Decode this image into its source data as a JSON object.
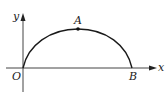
{
  "diagram": {
    "type": "coordinate-curve",
    "axes": {
      "x_label": "x",
      "y_label": "y",
      "origin_label": "O"
    },
    "points": [
      {
        "name": "A",
        "description": "highest point of the arc"
      },
      {
        "name": "B",
        "description": "curve meets x-axis"
      }
    ],
    "curve": "arc from O rising to A then descending to B on the x-axis",
    "colors": {
      "stroke": "#1a1a1a",
      "background": "#ffffff"
    }
  }
}
